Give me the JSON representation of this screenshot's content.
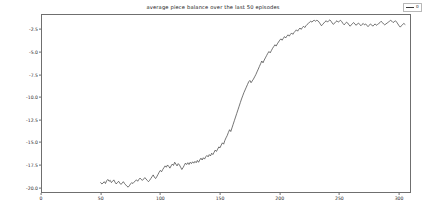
{
  "chart_data": {
    "type": "line",
    "title": "average piece balance over the last 50 episodes",
    "xlabel": "",
    "ylabel": "",
    "xlim": [
      0,
      310
    ],
    "ylim": [
      -20.6,
      -0.8
    ],
    "grid": false,
    "legend": {
      "position": "upper right",
      "entries": [
        {
          "label": "0",
          "color": "#3a3a3a"
        }
      ]
    },
    "xticks": [
      0,
      50,
      100,
      150,
      200,
      250,
      300
    ],
    "xtick_labels": [
      "0",
      "50",
      "100",
      "150",
      "200",
      "250",
      "300"
    ],
    "yticks": [
      -2.5,
      -5.0,
      -7.5,
      -10.0,
      -12.5,
      -15.0,
      -17.5,
      -20.0
    ],
    "ytick_labels": [
      "-2.5",
      "-5.0",
      "-7.5",
      "-10.0",
      "-12.5",
      "-15.0",
      "-17.5",
      "-20.0"
    ],
    "series": [
      {
        "name": "0",
        "color": "#3a3a3a",
        "linewidth": 0.7,
        "x": [
          50,
          51,
          52,
          53,
          54,
          55,
          56,
          57,
          58,
          59,
          60,
          61,
          62,
          63,
          64,
          65,
          66,
          67,
          68,
          69,
          70,
          71,
          72,
          73,
          74,
          75,
          76,
          77,
          78,
          79,
          80,
          81,
          82,
          83,
          84,
          85,
          86,
          87,
          88,
          89,
          90,
          91,
          92,
          93,
          94,
          95,
          96,
          97,
          98,
          99,
          100,
          101,
          102,
          103,
          104,
          105,
          106,
          107,
          108,
          109,
          110,
          111,
          112,
          113,
          114,
          115,
          116,
          117,
          118,
          119,
          120,
          121,
          122,
          123,
          124,
          125,
          126,
          127,
          128,
          129,
          130,
          131,
          132,
          133,
          134,
          135,
          136,
          137,
          138,
          139,
          140,
          141,
          142,
          143,
          144,
          145,
          146,
          147,
          148,
          149,
          150,
          151,
          152,
          153,
          154,
          155,
          156,
          157,
          158,
          159,
          160,
          161,
          162,
          163,
          164,
          165,
          166,
          167,
          168,
          169,
          170,
          171,
          172,
          173,
          174,
          175,
          176,
          177,
          178,
          179,
          180,
          181,
          182,
          183,
          184,
          185,
          186,
          187,
          188,
          189,
          190,
          191,
          192,
          193,
          194,
          195,
          196,
          197,
          198,
          199,
          200,
          201,
          202,
          203,
          204,
          205,
          206,
          207,
          208,
          209,
          210,
          211,
          212,
          213,
          214,
          215,
          216,
          217,
          218,
          219,
          220,
          221,
          222,
          223,
          224,
          225,
          226,
          227,
          228,
          229,
          230,
          231,
          232,
          233,
          234,
          235,
          236,
          237,
          238,
          239,
          240,
          241,
          242,
          243,
          244,
          245,
          246,
          247,
          248,
          249,
          250,
          251,
          252,
          253,
          254,
          255,
          256,
          257,
          258,
          259,
          260,
          261,
          262,
          263,
          264,
          265,
          266,
          267,
          268,
          269,
          270,
          271,
          272,
          273,
          274,
          275,
          276,
          277,
          278,
          279,
          280,
          281,
          282,
          283,
          284,
          285,
          286,
          287,
          288,
          289,
          290,
          291,
          292,
          293,
          294,
          295,
          296,
          297,
          298,
          299,
          300,
          301,
          302,
          303,
          304,
          305
        ],
        "y": [
          -19.45,
          -19.6,
          -19.5,
          -19.35,
          -19.55,
          -19.25,
          -19.1,
          -19.3,
          -19.2,
          -19.45,
          -19.3,
          -19.15,
          -19.4,
          -19.6,
          -19.45,
          -19.3,
          -19.5,
          -19.65,
          -19.5,
          -19.35,
          -19.55,
          -19.7,
          -19.85,
          -19.95,
          -19.8,
          -19.6,
          -19.45,
          -19.55,
          -19.4,
          -19.25,
          -19.15,
          -19.3,
          -19.1,
          -18.95,
          -19.1,
          -19.2,
          -19.05,
          -18.9,
          -19.05,
          -19.2,
          -19.35,
          -19.2,
          -19.0,
          -18.8,
          -18.6,
          -18.85,
          -19.0,
          -18.8,
          -18.55,
          -18.3,
          -18.1,
          -18.25,
          -18.0,
          -17.8,
          -17.6,
          -17.75,
          -17.5,
          -17.65,
          -17.85,
          -17.6,
          -17.4,
          -17.55,
          -17.2,
          -17.4,
          -17.6,
          -17.35,
          -17.5,
          -17.75,
          -18.0,
          -17.8,
          -17.55,
          -17.3,
          -17.45,
          -17.25,
          -17.45,
          -17.2,
          -17.35,
          -17.15,
          -17.3,
          -17.1,
          -17.25,
          -17.0,
          -17.2,
          -16.95,
          -16.75,
          -16.95,
          -16.7,
          -16.85,
          -16.6,
          -16.45,
          -16.6,
          -16.35,
          -16.5,
          -16.2,
          -16.35,
          -16.1,
          -15.85,
          -16.0,
          -15.75,
          -15.5,
          -15.6,
          -15.3,
          -15.05,
          -15.2,
          -14.8,
          -14.5,
          -14.25,
          -13.9,
          -13.6,
          -13.8,
          -13.4,
          -13.0,
          -12.6,
          -12.2,
          -11.8,
          -11.4,
          -11.0,
          -10.6,
          -10.2,
          -9.85,
          -9.5,
          -9.2,
          -8.9,
          -8.6,
          -8.3,
          -8.15,
          -8.4,
          -8.2,
          -8.0,
          -7.75,
          -7.5,
          -7.2,
          -6.9,
          -6.6,
          -6.3,
          -6.0,
          -6.2,
          -5.9,
          -5.65,
          -5.4,
          -5.15,
          -4.95,
          -5.1,
          -4.85,
          -4.6,
          -4.4,
          -4.2,
          -4.35,
          -4.1,
          -3.9,
          -3.7,
          -3.55,
          -3.7,
          -3.5,
          -3.3,
          -3.45,
          -3.25,
          -3.1,
          -3.25,
          -3.05,
          -2.9,
          -3.05,
          -2.85,
          -2.7,
          -2.55,
          -2.7,
          -2.5,
          -2.35,
          -2.5,
          -2.3,
          -2.15,
          -2.3,
          -2.1,
          -1.95,
          -1.85,
          -1.7,
          -1.6,
          -1.7,
          -1.55,
          -1.5,
          -1.6,
          -1.5,
          -1.55,
          -1.7,
          -1.9,
          -2.1,
          -1.95,
          -1.8,
          -1.65,
          -1.55,
          -1.7,
          -1.55,
          -1.45,
          -1.6,
          -1.8,
          -1.95,
          -1.8,
          -1.65,
          -1.55,
          -1.7,
          -1.6,
          -1.5,
          -1.65,
          -1.85,
          -2.0,
          -1.85,
          -1.7,
          -1.8,
          -2.0,
          -2.15,
          -2.0,
          -1.85,
          -1.75,
          -1.9,
          -2.05,
          -1.9,
          -1.8,
          -1.95,
          -2.1,
          -1.95,
          -1.85,
          -2.0,
          -1.9,
          -2.05,
          -2.2,
          -2.05,
          -1.9,
          -2.0,
          -2.15,
          -2.0,
          -1.9,
          -2.05,
          -1.95,
          -1.85,
          -1.75,
          -1.6,
          -1.75,
          -1.9,
          -2.0,
          -1.9,
          -1.8,
          -1.7,
          -1.6,
          -1.5,
          -1.6,
          -1.75,
          -1.65,
          -1.55,
          -1.7,
          -1.9,
          -2.1,
          -2.25,
          -2.1,
          -1.95,
          -1.85,
          -1.95
        ]
      }
    ]
  }
}
